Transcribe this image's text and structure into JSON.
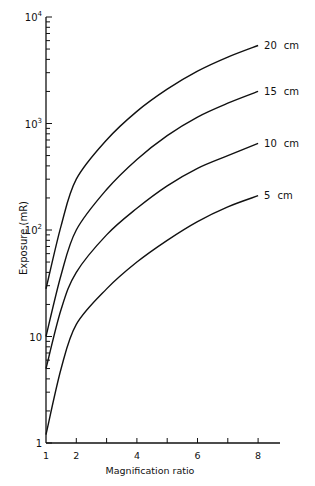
{
  "chart_data": {
    "type": "line",
    "title": "",
    "xlabel": "Magnification ratio",
    "ylabel": "Exposure (mR)",
    "xscale": "linear",
    "yscale": "log",
    "xlim": [
      1,
      8.7
    ],
    "ylim": [
      1,
      10000
    ],
    "x_ticks": [
      1,
      2,
      3,
      4,
      5,
      6,
      7,
      8
    ],
    "x_tick_labels": [
      "1",
      "2",
      "",
      "4",
      "",
      "6",
      "",
      "8"
    ],
    "y_tick_labels": [
      "1",
      "10",
      "10²",
      "10³",
      "10⁴"
    ],
    "grid": false,
    "legend": "inline labels at curve ends",
    "x": [
      1,
      1.5,
      2,
      3,
      4,
      5,
      6,
      7,
      8
    ],
    "series": [
      {
        "name": "20 cm",
        "values": [
          28,
          110,
          300,
          700,
          1300,
          2100,
          3100,
          4200,
          5400
        ]
      },
      {
        "name": "15 cm",
        "values": [
          10,
          38,
          100,
          240,
          460,
          770,
          1150,
          1550,
          2000
        ]
      },
      {
        "name": "10 cm",
        "values": [
          5,
          18,
          40,
          90,
          160,
          260,
          380,
          500,
          650
        ]
      },
      {
        "name": "5 cm",
        "values": [
          1.2,
          5,
          13,
          28,
          50,
          80,
          120,
          165,
          210
        ]
      }
    ]
  }
}
